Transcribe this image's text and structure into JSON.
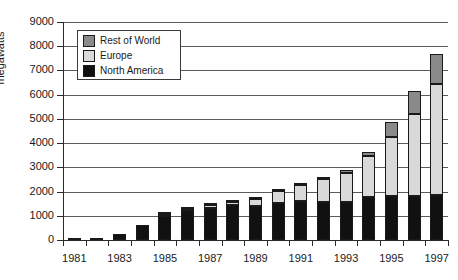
{
  "chart_data": {
    "type": "bar",
    "subtype": "stacked-bar",
    "title": "",
    "xlabel": "",
    "ylabel": "megawatts",
    "ylim": [
      0,
      9000
    ],
    "ytick_labels": [
      "9000",
      "8000",
      "7000",
      "6000",
      "5000",
      "4000",
      "3000",
      "2000",
      "1000",
      "0"
    ],
    "ytick_values": [
      9000,
      8000,
      7000,
      6000,
      5000,
      4000,
      3000,
      2000,
      1000,
      0
    ],
    "grid": "horizontal",
    "legend_position": "upper-left-inside",
    "categories": [
      "1981",
      "1982",
      "1983",
      "1984",
      "1985",
      "1986",
      "1987",
      "1988",
      "1989",
      "1990",
      "1991",
      "1992",
      "1993",
      "1994",
      "1995",
      "1996",
      "1997"
    ],
    "xtick_labels_shown": [
      "1981",
      "1983",
      "1985",
      "1987",
      "1989",
      "1991",
      "1993",
      "1995",
      "1997"
    ],
    "series": [
      {
        "name": "North America",
        "color": "#111111",
        "values": [
          25,
          95,
          260,
          620,
          1000,
          1250,
          1340,
          1450,
          1390,
          1520,
          1600,
          1570,
          1570,
          1760,
          1810,
          1830,
          1860
        ]
      },
      {
        "name": "Europe",
        "color": "#d9d9d9",
        "values": [
          0,
          0,
          0,
          0,
          70,
          50,
          110,
          110,
          320,
          500,
          680,
          950,
          1200,
          1720,
          2460,
          3390,
          4570
        ]
      },
      {
        "name": "Rest of World",
        "color": "#8a8a8a",
        "values": [
          0,
          0,
          0,
          0,
          20,
          20,
          30,
          30,
          30,
          30,
          30,
          90,
          110,
          150,
          620,
          940,
          1250
        ]
      }
    ],
    "totals": [
      25,
      95,
      260,
      620,
      1090,
      1320,
      1480,
      1590,
      1740,
      2050,
      2310,
      2610,
      2880,
      3630,
      4890,
      6160,
      7680
    ]
  },
  "legend": {
    "items": [
      {
        "label": "Rest of World",
        "color": "#8a8a8a"
      },
      {
        "label": "Europe",
        "color": "#d9d9d9"
      },
      {
        "label": "North America",
        "color": "#111111"
      }
    ]
  },
  "axis": {
    "y_title": "megawatts"
  }
}
